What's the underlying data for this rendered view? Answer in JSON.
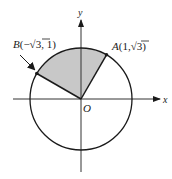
{
  "diagram": {
    "type": "unit-circle-sector",
    "colors": {
      "stroke": "#1a1a1a",
      "sector_fill": "#c8c8c8",
      "axis": "#333333",
      "background": "#ffffff"
    },
    "axes": {
      "x_label": "x",
      "y_label": "y",
      "origin_label": "O"
    },
    "circle": {
      "center_px": [
        81,
        99
      ],
      "radius_px": 51
    },
    "points": [
      {
        "name": "A",
        "label": "A",
        "coords_text": "(1,√3)",
        "angle_deg": 60
      },
      {
        "name": "B",
        "label": "B",
        "coords_text": "(−√3, 1)",
        "angle_deg": 150
      }
    ],
    "sector": {
      "from_deg": 60,
      "to_deg": 150,
      "shaded": true
    },
    "annotations": [
      {
        "type": "arrow",
        "target": "B",
        "description": "pointer arrow from label to point B"
      }
    ]
  }
}
